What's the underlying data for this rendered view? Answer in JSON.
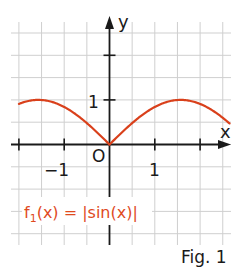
{
  "chart_data": {
    "type": "line",
    "title": "",
    "xlabel": "x",
    "ylabel": "y",
    "xlim": [
      -2.0,
      2.65
    ],
    "ylim": [
      -2.3,
      2.8
    ],
    "grid": true,
    "grid_step": 0.5,
    "x_ticks": [
      -2,
      -1,
      1,
      2
    ],
    "y_ticks": [
      1,
      2
    ],
    "tick_labels": {
      "x_neg": "−1",
      "x_pos": "1",
      "origin": "O",
      "y": "1"
    },
    "series": [
      {
        "name": "f1(x) = |sin(x)|",
        "function": "abs(sin(x))",
        "color": "#d9401b",
        "x": [
          -2.0,
          -1.75,
          -1.5708,
          -1.25,
          -1.0,
          -0.75,
          -0.5,
          -0.25,
          0,
          0.25,
          0.5,
          0.75,
          1.0,
          1.25,
          1.5708,
          1.75,
          2.0,
          2.25,
          2.65
        ],
        "y": [
          0.909,
          0.984,
          1.0,
          0.949,
          0.841,
          0.682,
          0.479,
          0.247,
          0,
          0.247,
          0.479,
          0.682,
          0.841,
          0.949,
          1.0,
          0.984,
          0.909,
          0.778,
          0.472
        ]
      }
    ],
    "annotations": [
      {
        "text": "f1(x) = |sin(x)|",
        "position": "lower-left"
      }
    ]
  },
  "labels": {
    "x_axis": "x",
    "y_axis": "y",
    "x_neg_one": "−1",
    "x_one": "1",
    "origin": "O",
    "y_one": "1",
    "formula_f": "f",
    "formula_sub": "1",
    "formula_rest": "(x) = |sin(x)|",
    "caption": "Fig. 1"
  },
  "colors": {
    "curve": "#d9401b",
    "formula": "#e04a1e",
    "axis": "#1a1a1a",
    "grid": "#cfcfcf"
  }
}
